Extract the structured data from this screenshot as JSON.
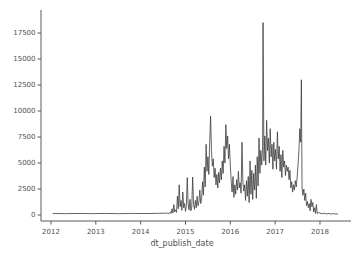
{
  "chart_data": {
    "type": "line",
    "title": "",
    "xlabel": "dt_publish_date",
    "ylabel": "",
    "grid": false,
    "legend": "none",
    "line_color": "#3c3c3c",
    "spine_color": "#5a5a5a",
    "tick_label_color": "#4f4f4f",
    "xlim": [
      2011.777,
      2018.692
    ],
    "ylim": [
      -577,
      19713
    ],
    "xticks": [
      2012,
      2013,
      2014,
      2015,
      2016,
      2017,
      2018
    ],
    "xtick_labels": [
      "2012",
      "2013",
      "2014",
      "2015",
      "2016",
      "2017",
      "2018"
    ],
    "yticks": [
      0,
      2500,
      5000,
      7500,
      10000,
      12500,
      15000,
      17500
    ],
    "ytick_labels": [
      "0",
      "2500",
      "5000",
      "7500",
      "10000",
      "12500",
      "15000",
      "17500"
    ],
    "series": [
      {
        "name": "count per dt_publish_date",
        "points": [
          [
            2012.04,
            150
          ],
          [
            2012.3,
            130
          ],
          [
            2012.6,
            150
          ],
          [
            2012.9,
            130
          ],
          [
            2013.2,
            150
          ],
          [
            2013.5,
            130
          ],
          [
            2013.8,
            150
          ],
          [
            2014.1,
            140
          ],
          [
            2014.4,
            160
          ],
          [
            2014.6,
            180
          ],
          [
            2014.63,
            120
          ],
          [
            2014.66,
            300
          ],
          [
            2014.68,
            150
          ],
          [
            2014.7,
            600
          ],
          [
            2014.72,
            200
          ],
          [
            2014.74,
            1000
          ],
          [
            2014.76,
            300
          ],
          [
            2014.78,
            500
          ],
          [
            2014.8,
            250
          ],
          [
            2014.82,
            1800
          ],
          [
            2014.84,
            600
          ],
          [
            2014.86,
            2900
          ],
          [
            2014.88,
            800
          ],
          [
            2014.9,
            1400
          ],
          [
            2014.92,
            450
          ],
          [
            2014.94,
            2200
          ],
          [
            2014.96,
            700
          ],
          [
            2014.98,
            1100
          ],
          [
            2015.0,
            350
          ],
          [
            2015.02,
            900
          ],
          [
            2015.04,
            3600
          ],
          [
            2015.06,
            1000
          ],
          [
            2015.08,
            500
          ],
          [
            2015.1,
            1500
          ],
          [
            2015.12,
            400
          ],
          [
            2015.14,
            800
          ],
          [
            2015.16,
            3650
          ],
          [
            2015.18,
            1000
          ],
          [
            2015.2,
            550
          ],
          [
            2015.22,
            1400
          ],
          [
            2015.24,
            700
          ],
          [
            2015.26,
            1800
          ],
          [
            2015.28,
            900
          ],
          [
            2015.3,
            1300
          ],
          [
            2015.32,
            2400
          ],
          [
            2015.34,
            1100
          ],
          [
            2015.36,
            1600
          ],
          [
            2015.38,
            3200
          ],
          [
            2015.4,
            1900
          ],
          [
            2015.42,
            4600
          ],
          [
            2015.44,
            2700
          ],
          [
            2015.46,
            6800
          ],
          [
            2015.48,
            4200
          ],
          [
            2015.5,
            5600
          ],
          [
            2015.52,
            3900
          ],
          [
            2015.54,
            7000
          ],
          [
            2015.56,
            9500
          ],
          [
            2015.58,
            6200
          ],
          [
            2015.6,
            4700
          ],
          [
            2015.62,
            5400
          ],
          [
            2015.64,
            3600
          ],
          [
            2015.66,
            4500
          ],
          [
            2015.68,
            2900
          ],
          [
            2015.7,
            3900
          ],
          [
            2015.72,
            2600
          ],
          [
            2015.74,
            4100
          ],
          [
            2015.76,
            3100
          ],
          [
            2015.78,
            4500
          ],
          [
            2015.8,
            3400
          ],
          [
            2015.82,
            5200
          ],
          [
            2015.84,
            4000
          ],
          [
            2015.86,
            6600
          ],
          [
            2015.88,
            5000
          ],
          [
            2015.9,
            8700
          ],
          [
            2015.92,
            6400
          ],
          [
            2015.94,
            7600
          ],
          [
            2015.96,
            5400
          ],
          [
            2015.98,
            6800
          ],
          [
            2016.0,
            4800
          ],
          [
            2016.02,
            3200
          ],
          [
            2016.04,
            2200
          ],
          [
            2016.06,
            3700
          ],
          [
            2016.08,
            1700
          ],
          [
            2016.1,
            2900
          ],
          [
            2016.12,
            2000
          ],
          [
            2016.14,
            3400
          ],
          [
            2016.16,
            2400
          ],
          [
            2016.18,
            4200
          ],
          [
            2016.2,
            2600
          ],
          [
            2016.22,
            3100
          ],
          [
            2016.24,
            2100
          ],
          [
            2016.26,
            7000
          ],
          [
            2016.28,
            3200
          ],
          [
            2016.3,
            2300
          ],
          [
            2016.32,
            2900
          ],
          [
            2016.34,
            1400
          ],
          [
            2016.36,
            3300
          ],
          [
            2016.38,
            1800
          ],
          [
            2016.4,
            3700
          ],
          [
            2016.42,
            1200
          ],
          [
            2016.44,
            5200
          ],
          [
            2016.46,
            2000
          ],
          [
            2016.48,
            4300
          ],
          [
            2016.5,
            1500
          ],
          [
            2016.52,
            4000
          ],
          [
            2016.54,
            2400
          ],
          [
            2016.56,
            4800
          ],
          [
            2016.58,
            1600
          ],
          [
            2016.6,
            5600
          ],
          [
            2016.62,
            2800
          ],
          [
            2016.64,
            7400
          ],
          [
            2016.66,
            4000
          ],
          [
            2016.68,
            6200
          ],
          [
            2016.7,
            4800
          ],
          [
            2016.72,
            6600
          ],
          [
            2016.73,
            18500
          ],
          [
            2016.75,
            5200
          ],
          [
            2016.77,
            7600
          ],
          [
            2016.79,
            4800
          ],
          [
            2016.81,
            9100
          ],
          [
            2016.83,
            6200
          ],
          [
            2016.85,
            7400
          ],
          [
            2016.87,
            5000
          ],
          [
            2016.89,
            8300
          ],
          [
            2016.91,
            5600
          ],
          [
            2016.93,
            6800
          ],
          [
            2016.95,
            4400
          ],
          [
            2016.97,
            7000
          ],
          [
            2016.99,
            5200
          ],
          [
            2017.01,
            6300
          ],
          [
            2017.03,
            4400
          ],
          [
            2017.05,
            8000
          ],
          [
            2017.07,
            5400
          ],
          [
            2017.09,
            6600
          ],
          [
            2017.11,
            4200
          ],
          [
            2017.13,
            5800
          ],
          [
            2017.15,
            3600
          ],
          [
            2017.17,
            6200
          ],
          [
            2017.19,
            4600
          ],
          [
            2017.21,
            5200
          ],
          [
            2017.23,
            3800
          ],
          [
            2017.25,
            4800
          ],
          [
            2017.27,
            4200
          ],
          [
            2017.29,
            4600
          ],
          [
            2017.31,
            3400
          ],
          [
            2017.33,
            4300
          ],
          [
            2017.35,
            2600
          ],
          [
            2017.37,
            3200
          ],
          [
            2017.39,
            2200
          ],
          [
            2017.41,
            2900
          ],
          [
            2017.43,
            2400
          ],
          [
            2017.45,
            3300
          ],
          [
            2017.47,
            2700
          ],
          [
            2017.49,
            3600
          ],
          [
            2017.51,
            4800
          ],
          [
            2017.53,
            6200
          ],
          [
            2017.55,
            8300
          ],
          [
            2017.57,
            7000
          ],
          [
            2017.585,
            13000
          ],
          [
            2017.6,
            2600
          ],
          [
            2017.62,
            1900
          ],
          [
            2017.64,
            2500
          ],
          [
            2017.66,
            1400
          ],
          [
            2017.68,
            2100
          ],
          [
            2017.7,
            900
          ],
          [
            2017.72,
            1300
          ],
          [
            2017.74,
            700
          ],
          [
            2017.76,
            1100
          ],
          [
            2017.78,
            400
          ],
          [
            2017.8,
            1500
          ],
          [
            2017.82,
            800
          ],
          [
            2017.84,
            1200
          ],
          [
            2017.86,
            300
          ],
          [
            2017.88,
            700
          ],
          [
            2017.9,
            150
          ],
          [
            2017.92,
            1000
          ],
          [
            2017.94,
            120
          ],
          [
            2017.97,
            250
          ],
          [
            2018.0,
            180
          ],
          [
            2018.05,
            120
          ],
          [
            2018.1,
            170
          ],
          [
            2018.15,
            100
          ],
          [
            2018.2,
            150
          ],
          [
            2018.25,
            90
          ],
          [
            2018.3,
            130
          ],
          [
            2018.35,
            100
          ],
          [
            2018.4,
            110
          ]
        ]
      }
    ],
    "plot_box_px": {
      "left": 41,
      "top": 10,
      "right": 351,
      "bottom": 221
    }
  }
}
